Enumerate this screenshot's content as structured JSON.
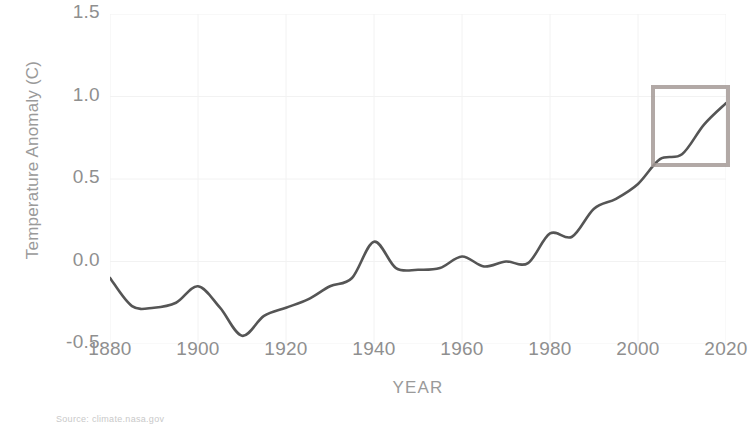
{
  "source_note": "Source: climate.nasa.gov",
  "axes": {
    "y_title": "Temperature Anomaly (C)",
    "x_title": "YEAR",
    "y_ticks": [
      "1.5",
      "1.0",
      "0.5",
      "0.0",
      "-0.5"
    ],
    "x_ticks": [
      "1880",
      "1900",
      "1920",
      "1940",
      "1960",
      "1980",
      "2000",
      "2020"
    ]
  },
  "annotation": {
    "type": "rectangle",
    "color": "#a59a96",
    "x_range": [
      2003,
      2021
    ],
    "y_range": [
      0.57,
      1.07
    ]
  },
  "style": {
    "line_color": "#555555",
    "grid_color": "#f2f2f2",
    "tick_label_color": "#8f8f8f",
    "axis_title_color": "#9a9a9a",
    "source_color": "#c9c9c9",
    "background": "#ffffff"
  },
  "chart_data": {
    "type": "line",
    "title": "",
    "subtitle": "",
    "xlabel": "YEAR",
    "ylabel": "Temperature Anomaly (C)",
    "xlim": [
      1880,
      2020
    ],
    "ylim": [
      -0.5,
      1.5
    ],
    "xticks": [
      1880,
      1900,
      1920,
      1940,
      1960,
      1980,
      2000,
      2020
    ],
    "yticks": [
      -0.5,
      0.0,
      0.5,
      1.0,
      1.5
    ],
    "grid": true,
    "legend": null,
    "series": [
      {
        "name": "Global Land-Ocean Temperature Anomaly",
        "color": "#555555",
        "x": [
          1880,
          1885,
          1890,
          1895,
          1900,
          1905,
          1910,
          1915,
          1920,
          1925,
          1930,
          1935,
          1940,
          1945,
          1950,
          1955,
          1960,
          1965,
          1970,
          1975,
          1980,
          1985,
          1990,
          1995,
          2000,
          2005,
          2010,
          2015,
          2020
        ],
        "y": [
          -0.1,
          -0.27,
          -0.28,
          -0.25,
          -0.15,
          -0.28,
          -0.45,
          -0.33,
          -0.28,
          -0.23,
          -0.15,
          -0.1,
          0.12,
          -0.04,
          -0.05,
          -0.04,
          0.03,
          -0.03,
          0.0,
          -0.01,
          0.17,
          0.15,
          0.32,
          0.38,
          0.47,
          0.62,
          0.65,
          0.83,
          0.96
        ]
      }
    ],
    "annotations": [
      {
        "type": "rectangle",
        "x_range": [
          2003,
          2021
        ],
        "y_range": [
          0.57,
          1.07
        ],
        "edge_color": "#a59a96",
        "fill": "none"
      }
    ]
  }
}
